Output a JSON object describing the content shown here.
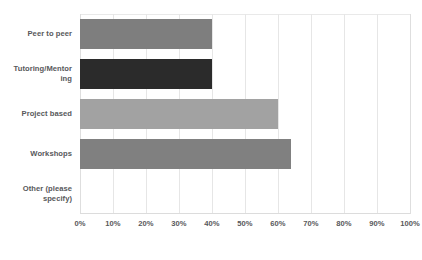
{
  "chart_data": {
    "type": "bar",
    "orientation": "horizontal",
    "title": "",
    "subtitle": "",
    "xlabel": "",
    "ylabel": "",
    "xlim": [
      0,
      100
    ],
    "grid": true,
    "legend": false,
    "categories": [
      "Peer to peer",
      "Tutoring/Mentoring",
      "Project based",
      "Workshops",
      "Other (please specify)"
    ],
    "values": [
      40,
      40,
      60,
      64,
      0
    ],
    "bar_colors": [
      "#7e7e7e",
      "#2b2b2b",
      "#a2a2a2",
      "#808080",
      "#ffffff"
    ],
    "tick_labels": [
      "0%",
      "10%",
      "20%",
      "30%",
      "40%",
      "50%",
      "60%",
      "70%",
      "80%",
      "90%",
      "100%"
    ],
    "tick_values": [
      0,
      10,
      20,
      30,
      40,
      50,
      60,
      70,
      80,
      90,
      100
    ],
    "value_format": "percent"
  },
  "colors": {
    "background": "#ffffff",
    "text": "#58595b",
    "gridline": "#e6e6e6",
    "axis": "#dcdcdc"
  },
  "category_labels": [
    "Peer to peer",
    "Tutoring/Mentor\ning",
    "Project based",
    "Workshops",
    "Other (please\nspecify)"
  ]
}
